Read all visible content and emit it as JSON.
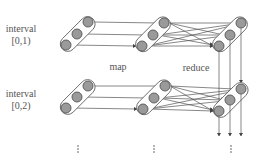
{
  "diagram": {
    "rows": [
      {
        "label_line1": "interval",
        "label_line2": "[0,1)"
      },
      {
        "label_line1": "interval",
        "label_line2": "[0,2)"
      }
    ],
    "phase_labels": {
      "map": "map",
      "reduce": "reduce"
    },
    "continuation": "⋮",
    "nodes_per_group": 3,
    "groups_per_row": 3,
    "colors": {
      "node_fill": "#9a9a9a",
      "node_stroke": "#555555",
      "capsule_stroke": "#666666",
      "edge": "#555555",
      "text": "#555555"
    }
  }
}
